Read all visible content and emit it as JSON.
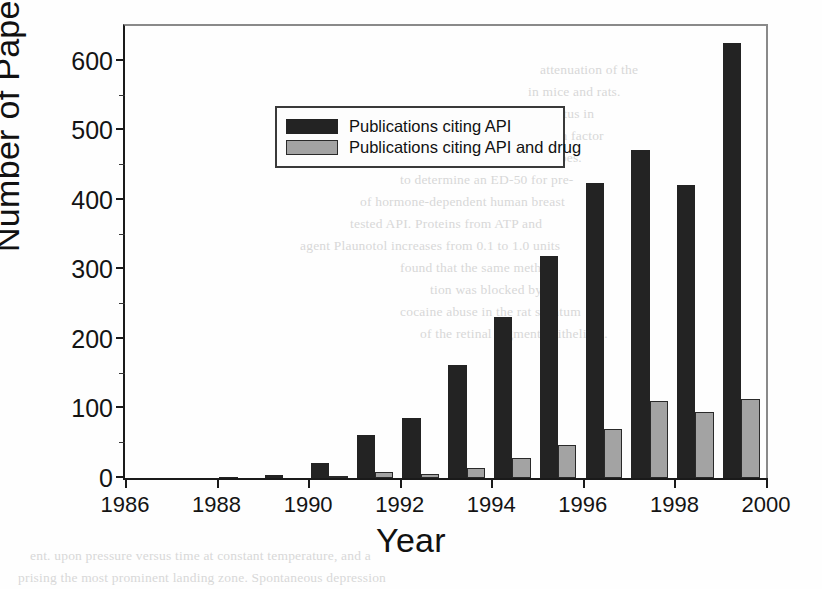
{
  "chart_data": {
    "type": "bar",
    "title": "",
    "xlabel": "Year",
    "ylabel": "Number of Papers",
    "xlim": [
      1986,
      2000
    ],
    "ylim": [
      0,
      650
    ],
    "grid": false,
    "legend_position": "upper left",
    "x": [
      1986,
      1987,
      1988,
      1989,
      1990,
      1991,
      1992,
      1993,
      1994,
      1995,
      1996,
      1997,
      1998,
      1999
    ],
    "categories": [
      "1986",
      "1987",
      "1988",
      "1989",
      "1990",
      "1991",
      "1992",
      "1993",
      "1994",
      "1995",
      "1996",
      "1997",
      "1998",
      "1999"
    ],
    "series": [
      {
        "name": "Publications citing API",
        "color": "#232323",
        "values": [
          0,
          0,
          2,
          5,
          21,
          62,
          87,
          163,
          231,
          319,
          424,
          471,
          421,
          625
        ]
      },
      {
        "name": "Publications citing API and drug",
        "color": "#a3a3a3",
        "values": [
          0,
          0,
          0,
          0,
          2,
          9,
          6,
          15,
          29,
          48,
          70,
          111,
          95,
          113
        ]
      }
    ],
    "xticks": [
      1986,
      1988,
      1990,
      1992,
      1994,
      1996,
      1998,
      2000
    ],
    "xtick_labels": [
      "1986",
      "1988",
      "1990",
      "1992",
      "1994",
      "1996",
      "1998",
      "2000"
    ],
    "yticks": [
      0,
      100,
      200,
      300,
      400,
      500,
      600
    ],
    "ytick_labels": [
      "0",
      "100",
      "200",
      "300",
      "400",
      "500",
      "600"
    ]
  },
  "legend": {
    "items": [
      {
        "label": "Publications citing API",
        "swatch": "dark"
      },
      {
        "label": "Publications citing API and drug",
        "swatch": "gray"
      }
    ]
  },
  "background_text": {
    "right_column": [
      "attenuation of the",
      "in mice and rats.",
      "of diabetes mellitus in",
      "nuclear transcription factor",
      "cus, the cause of genital herpes.",
      "to determine an ED-50 for pre-",
      "of hormone-dependent human breast",
      "tested API. Proteins from ATP and",
      "agent Plaunotol increases from 0.1 to 1.0 units",
      "found that the same method",
      "tion was blocked by",
      "cocaine abuse in the rat striatum",
      "of the retinal pigment epithelium."
    ],
    "bottom": [
      "ent. upon pressure versus time at constant temperature, and a",
      "prising the most prominent landing zone. Spontaneous depression"
    ]
  }
}
